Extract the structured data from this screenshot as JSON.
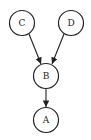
{
  "diagram": {
    "type": "directed-graph",
    "nodes": [
      {
        "id": "C",
        "label": "C",
        "x": 22,
        "y": 23
      },
      {
        "id": "D",
        "label": "D",
        "x": 71,
        "y": 23
      },
      {
        "id": "B",
        "label": "B",
        "x": 46,
        "y": 76
      },
      {
        "id": "A",
        "label": "A",
        "x": 46,
        "y": 121
      }
    ],
    "edges": [
      {
        "from": "C",
        "to": "B"
      },
      {
        "from": "D",
        "to": "B"
      },
      {
        "from": "B",
        "to": "A"
      }
    ],
    "colors": {
      "stroke": "#222222",
      "fill": "#ffffff"
    }
  }
}
